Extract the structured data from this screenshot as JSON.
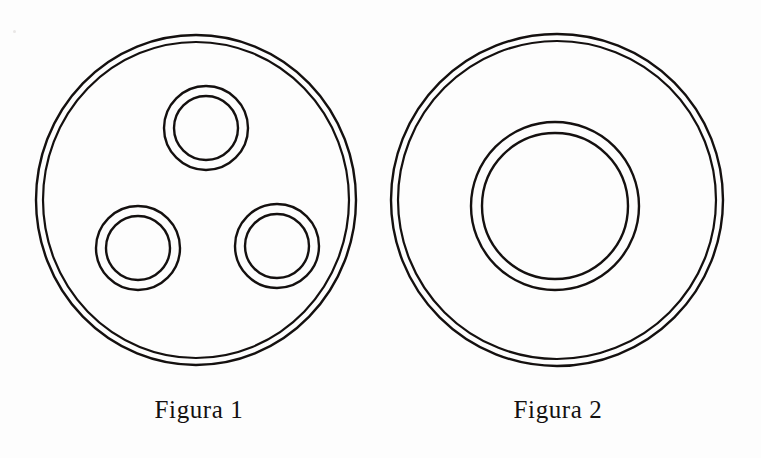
{
  "page": {
    "background_color": "#fdfdfd",
    "ink_color": "#14100f",
    "width": 761,
    "height": 458
  },
  "figures": [
    {
      "id": "figure-1",
      "caption": "Figura 1",
      "caption_center": {
        "x": 199,
        "y": 410
      },
      "body": {
        "name": "outer-plate-ring",
        "center": {
          "x": 196,
          "y": 200
        },
        "outer_radius_x": 160,
        "outer_radius_y": 165,
        "inner_radius_x": 153,
        "inner_radius_y": 158
      },
      "holes": [
        {
          "name": "hole-top",
          "center": {
            "x": 206,
            "y": 128
          },
          "outer_radius": 42,
          "inner_radius": 32
        },
        {
          "name": "hole-bottom-left",
          "center": {
            "x": 138,
            "y": 248
          },
          "outer_radius": 42,
          "inner_radius": 32
        },
        {
          "name": "hole-bottom-right",
          "center": {
            "x": 277,
            "y": 246
          },
          "outer_radius": 42,
          "inner_radius": 32
        }
      ],
      "hole_count": 3
    },
    {
      "id": "figure-2",
      "caption": "Figura 2",
      "caption_center": {
        "x": 558,
        "y": 410
      },
      "body": {
        "name": "outer-plate-ring",
        "center": {
          "x": 557,
          "y": 200
        },
        "outer_radius_x": 166,
        "outer_radius_y": 166,
        "inner_radius_x": 159,
        "inner_radius_y": 159
      },
      "holes": [
        {
          "name": "hole-center",
          "center": {
            "x": 555,
            "y": 206
          },
          "outer_radius": 84,
          "inner_radius": 73
        }
      ],
      "hole_count": 1
    }
  ],
  "stroke": {
    "color": "#14100f",
    "width": 2.2,
    "fill": "none"
  },
  "artifacts": [
    {
      "name": "scan-speck",
      "x": 13,
      "y": 30,
      "size": 3
    }
  ]
}
